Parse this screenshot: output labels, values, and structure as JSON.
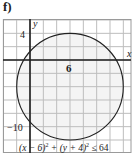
{
  "figure": {
    "label": "f)"
  },
  "chart_data": {
    "type": "region",
    "title": "",
    "xlabel": "x",
    "ylabel": "y",
    "xlim": [
      -4,
      15
    ],
    "ylim": [
      -14,
      6
    ],
    "grid": true,
    "grid_step": 2,
    "tick_labels": {
      "x": [
        {
          "value": 6,
          "label": "6"
        }
      ],
      "y": [
        {
          "value": 4,
          "label": "4"
        },
        {
          "value": -10,
          "label": "-10"
        }
      ]
    },
    "shape": {
      "kind": "circle",
      "center": [
        6,
        -4
      ],
      "radius": 8,
      "filled": true,
      "fill": "#f4f4f4",
      "stroke": "#222222"
    },
    "annotation": "(x − 6)² + (y + 4)² ≤ 64",
    "inequality": "(x-6)^2 + (y+4)^2 <= 64"
  },
  "labels": {
    "x_axis": "x",
    "y_axis": "y",
    "tick_6": "6",
    "tick_4": "4",
    "tick_neg10": "−10",
    "eq_part1": "(x − 6)",
    "eq_exp1": "2",
    "eq_part2": " + (y + 4)",
    "eq_exp2": "2",
    "eq_part3": " ≤ 64"
  },
  "colors": {
    "grid": "#bdbdbd",
    "axis": "#1e1e1e",
    "circle": "#222222",
    "fill": "#f4f4f4"
  }
}
